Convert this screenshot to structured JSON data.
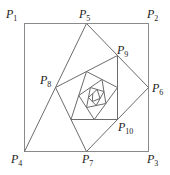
{
  "diagram": {
    "square": {
      "left": 24.5,
      "top": 23.5,
      "right": 148.5,
      "bottom": 151.5
    },
    "colors": {
      "stroke": "#6b6b6b",
      "square": "#8a8a8a",
      "text": "#222222"
    },
    "path_point_count": 26,
    "labels": [
      {
        "id": "P1",
        "letter": "P",
        "sub": "1",
        "x": 6,
        "y": 18
      },
      {
        "id": "P5",
        "letter": "P",
        "sub": "5",
        "x": 79,
        "y": 18
      },
      {
        "id": "P2",
        "letter": "P",
        "sub": "2",
        "x": 147,
        "y": 18
      },
      {
        "id": "P9",
        "letter": "P",
        "sub": "9",
        "x": 117,
        "y": 54
      },
      {
        "id": "P8",
        "letter": "P",
        "sub": "8",
        "x": 40,
        "y": 84
      },
      {
        "id": "P6",
        "letter": "P",
        "sub": "6",
        "x": 152,
        "y": 92
      },
      {
        "id": "P10",
        "letter": "P",
        "sub": "10",
        "x": 118,
        "y": 131
      },
      {
        "id": "P4",
        "letter": "P",
        "sub": "4",
        "x": 11,
        "y": 163
      },
      {
        "id": "P7",
        "letter": "P",
        "sub": "7",
        "x": 82,
        "y": 163
      },
      {
        "id": "P3",
        "letter": "P",
        "sub": "3",
        "x": 147,
        "y": 163
      }
    ]
  }
}
